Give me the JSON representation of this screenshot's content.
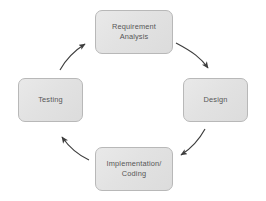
{
  "diagram": {
    "type": "cycle",
    "direction": "clockwise",
    "background_color": "#ffffff",
    "node_fill_color": "#e2e2e2",
    "node_border_color": "#b8b8b8",
    "node_text_color": "#565656",
    "arrow_color": "#3d3d3d",
    "nodes": [
      {
        "id": "requirement-analysis",
        "label": "Requirement\nAnalysis"
      },
      {
        "id": "design",
        "label": "Design"
      },
      {
        "id": "implementation-coding",
        "label": "Implementation/\nCoding"
      },
      {
        "id": "testing",
        "label": "Testing"
      }
    ],
    "arrows": [
      {
        "id": "requirement-to-design",
        "from": "requirement-analysis",
        "to": "design"
      },
      {
        "id": "design-to-implementation",
        "from": "design",
        "to": "implementation-coding"
      },
      {
        "id": "implementation-to-testing",
        "from": "implementation-coding",
        "to": "testing"
      },
      {
        "id": "testing-to-requirement",
        "from": "testing",
        "to": "requirement-analysis"
      }
    ]
  }
}
